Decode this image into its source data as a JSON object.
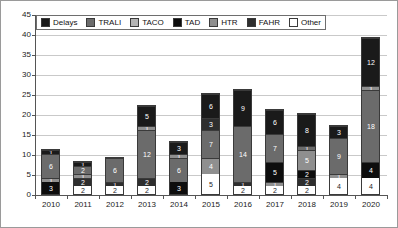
{
  "chart_data": {
    "type": "bar",
    "stacked": true,
    "title": "",
    "xlabel": "",
    "ylabel": "",
    "ylim": [
      0,
      45
    ],
    "ytick_step": 5,
    "yticks": [
      0,
      5,
      10,
      15,
      20,
      25,
      30,
      35,
      40,
      45
    ],
    "grid": true,
    "legend_position": "top-left-inside",
    "categories": [
      "2010",
      "2011",
      "2012",
      "2013",
      "2014",
      "2015",
      "2016",
      "2017",
      "2018",
      "2019",
      "2020"
    ],
    "series": [
      {
        "name": "Other",
        "color": "#ffffff",
        "values": [
          0,
          2,
          2,
          2,
          0,
          5,
          2,
          2,
          2,
          4,
          4
        ]
      },
      {
        "name": "TAD",
        "color": "#0d0d0d",
        "values": [
          3,
          0,
          0,
          0,
          3,
          0,
          0,
          0,
          2,
          0,
          4
        ]
      },
      {
        "name": "FAHR",
        "color": "#2e2e2e",
        "values": [
          0,
          2,
          2,
          2,
          0,
          0,
          1,
          5,
          2,
          0,
          0
        ]
      },
      {
        "name": "HTR",
        "color": "#8f8f8f",
        "values": [
          1,
          1,
          1,
          0,
          0,
          4,
          0,
          1,
          5,
          1,
          0
        ]
      },
      {
        "name": "TACO",
        "color": "#b4b4b4",
        "values": [
          0,
          0,
          0,
          0,
          0,
          0,
          0,
          0,
          0,
          0,
          0
        ]
      },
      {
        "name": "TRALI",
        "color": "#6b6b6b",
        "values": [
          6,
          2,
          6,
          12,
          6,
          7,
          14,
          7,
          1,
          9,
          18
        ]
      },
      {
        "name": "Delays",
        "color": "#1a1a1a",
        "values": [
          1,
          1,
          0,
          1,
          1,
          3,
          0,
          0,
          0,
          0,
          1
        ]
      },
      {
        "name": "Delays-top",
        "color": "#1a1a1a",
        "values": [
          0,
          0,
          0,
          5,
          3,
          6,
          9,
          6,
          8,
          3,
          12
        ]
      }
    ],
    "bars": [
      {
        "year": "2010",
        "total": 12,
        "segments": [
          {
            "series": "TAD",
            "value": 3,
            "label": "3"
          },
          {
            "series": "HTR",
            "value": 1,
            "label": "1"
          },
          {
            "series": "TRALI",
            "value": 6,
            "label": "6"
          },
          {
            "series": "Delays",
            "value": 1,
            "label": "1"
          }
        ]
      },
      {
        "year": "2011",
        "total": 8,
        "segments": [
          {
            "series": "Other",
            "value": 2,
            "label": "2"
          },
          {
            "series": "FAHR",
            "value": 2,
            "label": "2"
          },
          {
            "series": "HTR",
            "value": 1,
            "label": "1"
          },
          {
            "series": "TRALI",
            "value": 2,
            "label": "2"
          },
          {
            "series": "Delays",
            "value": 1,
            "label": "1"
          }
        ]
      },
      {
        "year": "2012",
        "total": 9,
        "segments": [
          {
            "series": "Other",
            "value": 2,
            "label": "2"
          },
          {
            "series": "FAHR",
            "value": 1,
            "label": "1"
          },
          {
            "series": "TRALI",
            "value": 6,
            "label": "6"
          }
        ]
      },
      {
        "year": "2013",
        "total": 22,
        "segments": [
          {
            "series": "Other",
            "value": 2,
            "label": "2"
          },
          {
            "series": "FAHR",
            "value": 2,
            "label": "2"
          },
          {
            "series": "TRALI",
            "value": 12,
            "label": "12"
          },
          {
            "series": "HTR",
            "value": 1,
            "label": "1"
          },
          {
            "series": "Delays",
            "value": 5,
            "label": "5"
          }
        ]
      },
      {
        "year": "2014",
        "total": 14,
        "segments": [
          {
            "series": "TAD",
            "value": 3,
            "label": "3"
          },
          {
            "series": "TRALI",
            "value": 6,
            "label": "6"
          },
          {
            "series": "HTR",
            "value": 1,
            "label": "1"
          },
          {
            "series": "Delays",
            "value": 3,
            "label": "3"
          }
        ]
      },
      {
        "year": "2015",
        "total": 25,
        "segments": [
          {
            "series": "Other",
            "value": 5,
            "label": "5"
          },
          {
            "series": "HTR",
            "value": 4,
            "label": "4"
          },
          {
            "series": "TRALI",
            "value": 7,
            "label": "7"
          },
          {
            "series": "FAHR",
            "value": 3,
            "label": "3"
          },
          {
            "series": "Delays",
            "value": 6,
            "label": "6"
          }
        ]
      },
      {
        "year": "2016",
        "total": 26,
        "segments": [
          {
            "series": "Other",
            "value": 2,
            "label": "2"
          },
          {
            "series": "FAHR",
            "value": 1,
            "label": "1"
          },
          {
            "series": "TRALI",
            "value": 14,
            "label": "14"
          },
          {
            "series": "Delays",
            "value": 9,
            "label": "9"
          }
        ]
      },
      {
        "year": "2017",
        "total": 20,
        "segments": [
          {
            "series": "Other",
            "value": 2,
            "label": "2"
          },
          {
            "series": "HTR",
            "value": 1,
            "label": "1"
          },
          {
            "series": "TAD",
            "value": 5,
            "label": "5"
          },
          {
            "series": "TRALI",
            "value": 7,
            "label": "7"
          },
          {
            "series": "Delays",
            "value": 6,
            "label": "6"
          }
        ]
      },
      {
        "year": "2018",
        "total": 20,
        "segments": [
          {
            "series": "Other",
            "value": 2,
            "label": "2"
          },
          {
            "series": "FAHR",
            "value": 2,
            "label": "2"
          },
          {
            "series": "TAD",
            "value": 2,
            "label": "2"
          },
          {
            "series": "HTR",
            "value": 5,
            "label": "5"
          },
          {
            "series": "TRALI",
            "value": 1,
            "label": "1"
          },
          {
            "series": "Delays",
            "value": 8,
            "label": "8"
          }
        ]
      },
      {
        "year": "2019",
        "total": 17,
        "segments": [
          {
            "series": "Other",
            "value": 4,
            "label": "4"
          },
          {
            "series": "HTR",
            "value": 1,
            "label": "1"
          },
          {
            "series": "TRALI",
            "value": 9,
            "label": "9"
          },
          {
            "series": "Delays",
            "value": 3,
            "label": "3"
          }
        ]
      },
      {
        "year": "2020",
        "total": 39,
        "segments": [
          {
            "series": "Other",
            "value": 4,
            "label": "4"
          },
          {
            "series": "TAD",
            "value": 4,
            "label": "4"
          },
          {
            "series": "TRALI",
            "value": 18,
            "label": "18"
          },
          {
            "series": "HTR",
            "value": 1,
            "label": "1"
          },
          {
            "series": "Delays",
            "value": 12,
            "label": "12"
          }
        ]
      }
    ],
    "legend": [
      {
        "label": "Delays",
        "color": "#1a1a1a"
      },
      {
        "label": "TRALI",
        "color": "#6b6b6b"
      },
      {
        "label": "TACO",
        "color": "#b4b4b4"
      },
      {
        "label": "TAD",
        "color": "#0d0d0d"
      },
      {
        "label": "HTR",
        "color": "#8f8f8f"
      },
      {
        "label": "FAHR",
        "color": "#2e2e2e"
      },
      {
        "label": "Other",
        "color": "#ffffff"
      }
    ]
  }
}
